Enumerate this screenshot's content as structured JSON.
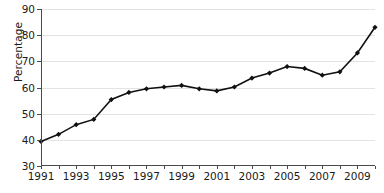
{
  "chart_data": {
    "type": "line",
    "title": "",
    "xlabel": "",
    "ylabel": "Percentage",
    "xlim": [
      1991,
      2010
    ],
    "ylim": [
      30,
      90
    ],
    "ytick_labels": [
      "30",
      "40",
      "50",
      "60",
      "70",
      "80",
      "90"
    ],
    "ytick_values": [
      30,
      40,
      50,
      60,
      70,
      80,
      90
    ],
    "xtick_labels": [
      "1991",
      "1993",
      "1995",
      "1997",
      "1999",
      "2001",
      "2003",
      "2005",
      "2007",
      "2009"
    ],
    "xtick_values": [
      1991,
      1993,
      1995,
      1997,
      1999,
      2001,
      2003,
      2005,
      2007,
      2009
    ],
    "x": [
      1991,
      1992,
      1993,
      1994,
      1995,
      1996,
      1997,
      1998,
      1999,
      2000,
      2001,
      2002,
      2003,
      2004,
      2005,
      2006,
      2007,
      2008,
      2009,
      2010
    ],
    "values": [
      39.4,
      42.1,
      45.8,
      47.8,
      55.4,
      58.1,
      59.5,
      60.2,
      60.8,
      59.5,
      58.7,
      60.2,
      63.6,
      65.5,
      68.0,
      67.3,
      64.7,
      66.0,
      73.2,
      83.0
    ],
    "series": [
      {
        "name": "Percentage",
        "values": [
          39.4,
          42.1,
          45.8,
          47.8,
          55.4,
          58.1,
          59.5,
          60.2,
          60.8,
          59.5,
          58.7,
          60.2,
          63.6,
          65.5,
          68.0,
          67.3,
          64.7,
          66.0,
          73.2,
          83.0
        ]
      }
    ],
    "grid": true,
    "grid_axis": "y",
    "legend": false,
    "legend_position": "none",
    "marker": "diamond",
    "line_color": "#111111",
    "marker_color": "#111111",
    "grid_color": "#e3e3e3",
    "axis_color": "#4a4a4a",
    "background": "#ffffff"
  }
}
